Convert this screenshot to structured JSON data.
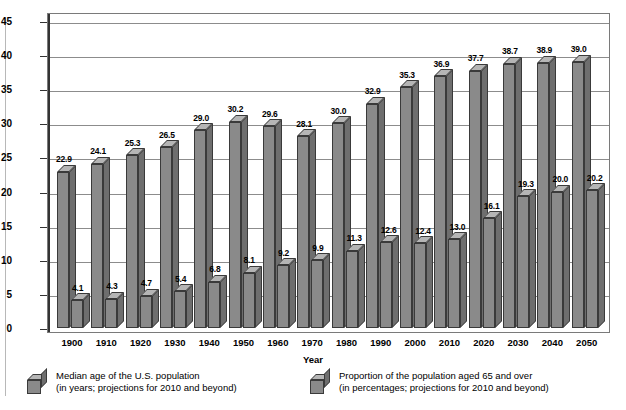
{
  "chart_data": {
    "type": "bar",
    "title": "",
    "xlabel": "Year",
    "ylabel": "",
    "ylim": [
      0,
      45
    ],
    "ytick_step": 5,
    "yticks": [
      "0",
      "5",
      "10",
      "15",
      "20",
      "25",
      "30",
      "35",
      "40",
      "45"
    ],
    "grid": true,
    "legend_position": "bottom",
    "categories": [
      "1900",
      "1910",
      "1920",
      "1930",
      "1940",
      "1950",
      "1960",
      "1970",
      "1980",
      "1990",
      "2000",
      "2010",
      "2020",
      "2030",
      "2040",
      "2050"
    ],
    "series": [
      {
        "name": "Median age of the U.S. population",
        "values": [
          22.9,
          24.1,
          25.3,
          26.5,
          29.0,
          30.2,
          29.6,
          28.1,
          30.0,
          32.9,
          35.3,
          36.9,
          37.7,
          38.7,
          38.9,
          39.0
        ],
        "labels": [
          "22.9",
          "24.1",
          "25.3",
          "26.5",
          "29.0",
          "30.2",
          "29.6",
          "28.1",
          "30.0",
          "32.9",
          "35.3",
          "36.9",
          "37.7",
          "38.7",
          "38.9",
          "39.0"
        ]
      },
      {
        "name": "Proportion of the population aged 65 and over",
        "values": [
          4.1,
          4.3,
          4.7,
          5.4,
          6.8,
          8.1,
          9.2,
          9.9,
          11.3,
          12.6,
          12.4,
          13.0,
          16.1,
          19.3,
          20.0,
          20.2
        ],
        "labels": [
          "4.1",
          "4.3",
          "4.7",
          "5.4",
          "6.8",
          "8.1",
          "9.2",
          "9.9",
          "11.3",
          "12.6",
          "12.4",
          "13.0",
          "16.1",
          "19.3",
          "20.0",
          "20.2"
        ]
      }
    ],
    "colors": {
      "bar_face": "#8a8a8a",
      "bar_top": "#b5b5b5",
      "bar_side": "#6e6e6e",
      "bar_edge": "#3a3a3a",
      "gridline": "#8c8c8c",
      "frame": "#7a7a7a"
    }
  },
  "axis": {
    "x_title": "Year"
  },
  "legend": {
    "items": [
      {
        "line1": "Median age of the U.S. population",
        "line2": "(in years; projections for 2010 and beyond)"
      },
      {
        "line1": "Proportion of the population aged 65 and over",
        "line2": "(in percentages; projections for 2010 and beyond)"
      }
    ]
  }
}
